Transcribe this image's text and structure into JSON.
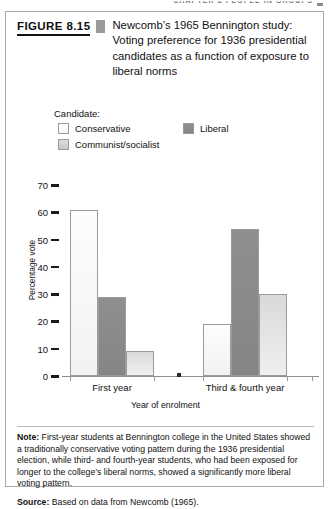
{
  "running_header": {
    "text": "CHAPTER 8  PEOPLE IN GROUPS"
  },
  "figure": {
    "number_label": "FIGURE 8.15",
    "title": "Newcomb’s 1965 Bennington study: Voting preference for 1936 presidential candidates as a function of exposure to liberal norms"
  },
  "legend": {
    "title": "Candidate:",
    "items": [
      {
        "label": "Conservative",
        "color": "#fbfbfb",
        "swatch_class": "sw-conservative"
      },
      {
        "label": "Liberal",
        "color": "#8a8a8a",
        "swatch_class": "sw-liberal"
      },
      {
        "label": "Communist/socialist",
        "color": "#d5d5d5",
        "swatch_class": "sw-communist"
      }
    ]
  },
  "chart_data": {
    "type": "bar",
    "title": "Newcomb’s 1965 Bennington study: Voting preference for 1936 presidential candidates as a function of exposure to liberal norms",
    "xlabel": "Year of enrolment",
    "ylabel": "Percentage vote",
    "categories": [
      "First year",
      "Third & fourth year"
    ],
    "series": [
      {
        "name": "Conservative",
        "values": [
          61,
          19
        ],
        "color": "#fbfbfb"
      },
      {
        "name": "Liberal",
        "values": [
          29,
          54
        ],
        "color": "#8a8a8a"
      },
      {
        "name": "Communist/socialist",
        "values": [
          9,
          30
        ],
        "color": "#d5d5d5"
      }
    ],
    "ylim": [
      0,
      70
    ],
    "yticks": [
      0,
      10,
      20,
      30,
      40,
      50,
      60,
      70
    ],
    "ytick_labels": [
      "0",
      "10",
      "20",
      "30",
      "40",
      "50",
      "60",
      "70"
    ],
    "grid": false,
    "legend_position": "above-plot"
  },
  "footer": {
    "note_label": "Note:",
    "note_body": " First-year students at Bennington college in the United States showed a traditionally conservative voting pattern during the 1936 presidential election, while third- and fourth-year students, who had been exposed for longer to the college’s liberal norms, showed a significantly more liberal voting pattern.",
    "source_label": "Source:",
    "source_body": " Based on data from Newcomb (1965)."
  }
}
